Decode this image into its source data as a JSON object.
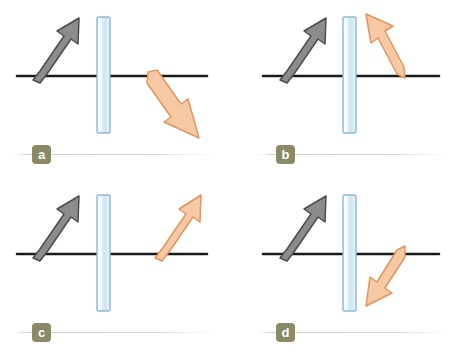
{
  "figure": {
    "background_color": "#ffffff",
    "width": 457,
    "height": 357
  },
  "palette": {
    "incident_arrow_fill": "#8c8c8c",
    "incident_arrow_stroke": "#4d4d4d",
    "outgoing_arrow_fill": "#f6c9a4",
    "outgoing_arrow_stroke": "#e2945c",
    "slab_fill_light": "#ffffff",
    "slab_fill_blue": "#cfe6f3",
    "slab_stroke": "#8fb9d4",
    "axis_line": "#1a1a1a",
    "badge_background": "#8a8a66",
    "badge_text": "#ffffff",
    "separator": "#aaaa96"
  },
  "panels": [
    {
      "id": "a",
      "badge_label": "a",
      "incident_arrow": {
        "name": "incident-ray-arrow",
        "direction": "up-right",
        "description": "Grey arrow rising from the left along the optical axis toward the slab",
        "tail": [
          34,
          78
        ],
        "tip": [
          75,
          20
        ]
      },
      "outgoing_arrow": {
        "name": "outgoing-ray-arrow",
        "direction": "down-right",
        "description": "Orange arrow leaving the right side of the slab bending downward below the axis",
        "tail": [
          152,
          76
        ],
        "tip": [
          196,
          134
        ]
      },
      "slab": {
        "name": "glass-slab",
        "x": 97,
        "y": 17,
        "width": 13,
        "height": 116
      },
      "axis": {
        "name": "optical-axis-line",
        "x1": 17,
        "y1": 76,
        "x2": 207,
        "y2": 76
      }
    },
    {
      "id": "b",
      "badge_label": "b",
      "incident_arrow": {
        "name": "incident-ray-arrow",
        "direction": "up-right",
        "description": "Grey arrow rising from the left along the optical axis toward the slab",
        "tail": [
          53,
          78
        ],
        "tip": [
          92,
          20
        ]
      },
      "outgoing_arrow": {
        "name": "outgoing-ray-arrow",
        "direction": "up-left",
        "description": "Orange arrow leaving the right of the slab and slanting back up to the left",
        "tail": [
          172,
          76
        ],
        "tip": [
          140,
          18
        ]
      },
      "slab": {
        "name": "glass-slab",
        "x": 114,
        "y": 17,
        "width": 13,
        "height": 116
      },
      "axis": {
        "name": "optical-axis-line",
        "x1": 34,
        "y1": 76,
        "x2": 210,
        "y2": 76
      }
    },
    {
      "id": "c",
      "badge_label": "c",
      "incident_arrow": {
        "name": "incident-ray-arrow",
        "direction": "up-right",
        "description": "Grey arrow rising from the left along the optical axis toward the slab",
        "tail": [
          34,
          78
        ],
        "tip": [
          74,
          20
        ]
      },
      "outgoing_arrow": {
        "name": "outgoing-ray-arrow",
        "direction": "up-right",
        "description": "Orange arrow leaving the right of the slab parallel to the incident grey arrow",
        "tail": [
          158,
          76
        ],
        "tip": [
          196,
          18
        ]
      },
      "slab": {
        "name": "glass-slab",
        "x": 97,
        "y": 17,
        "width": 13,
        "height": 116
      },
      "axis": {
        "name": "optical-axis-line",
        "x1": 17,
        "y1": 76,
        "x2": 207,
        "y2": 76
      }
    },
    {
      "id": "d",
      "badge_label": "d",
      "incident_arrow": {
        "name": "incident-ray-arrow",
        "direction": "up-right",
        "description": "Grey arrow rising from the left along the optical axis toward the slab",
        "tail": [
          53,
          78
        ],
        "tip": [
          92,
          20
        ]
      },
      "outgoing_arrow": {
        "name": "outgoing-ray-arrow",
        "direction": "down-left",
        "description": "Orange arrow leaving the right of the slab and slanting down to the left below the axis",
        "tail": [
          172,
          70
        ],
        "tip": [
          145,
          120
        ]
      },
      "slab": {
        "name": "glass-slab",
        "x": 114,
        "y": 17,
        "width": 13,
        "height": 116
      },
      "axis": {
        "name": "optical-axis-line",
        "x1": 34,
        "y1": 76,
        "x2": 210,
        "y2": 76
      }
    }
  ]
}
